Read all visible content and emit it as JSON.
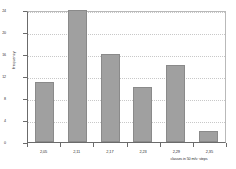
{
  "chart_data": {
    "type": "bar",
    "title": "",
    "subtitle": "",
    "xlabel": "classes in 50 m/s² steps",
    "ylabel": "frequency",
    "categories": [
      "2,05",
      "2,11",
      "2,17",
      "2,23",
      "2,29",
      "2,35"
    ],
    "values": [
      11,
      24,
      16,
      10,
      14,
      2
    ],
    "series": [
      {
        "name": "frequency",
        "values": [
          11,
          24,
          16,
          10,
          14,
          2
        ]
      }
    ],
    "ylim": [
      0,
      24
    ],
    "yticks": [
      0,
      4,
      8,
      12,
      16,
      20,
      24
    ],
    "ytick_labels": [
      "0",
      "4",
      "8",
      "12",
      "16",
      "20",
      "24"
    ],
    "xtick_labels": [
      "2,05",
      "2,11",
      "2,17",
      "2,23",
      "2,29",
      "2,35"
    ],
    "grid": "horizontal-dotted",
    "legend": "none",
    "bar_color": "#a0a0a0",
    "bar_border_color": "#8a8a8a",
    "axis_color": "#6b6b6b",
    "grid_color": "#c8c8c8",
    "background": "#ffffff",
    "annotations": []
  }
}
